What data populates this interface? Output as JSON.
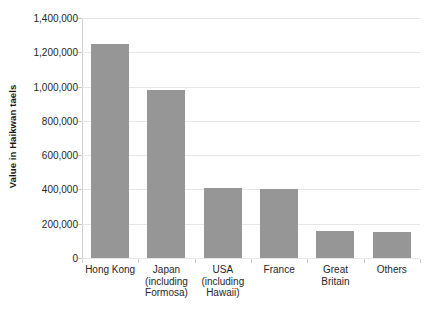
{
  "chart_data": {
    "type": "bar",
    "title": "",
    "xlabel": "",
    "ylabel": "Value in Haikwan taels",
    "ylim": [
      0,
      1400000
    ],
    "ytick_step": 200000,
    "grid": true,
    "legend": false,
    "orientation": "vertical",
    "bar_color": "#969696",
    "gridline_color": "#e6e6e6",
    "background_color": "#ffffff",
    "categories": [
      "Hong Kong",
      "Japan (including Formosa)",
      "USA (including Hawaii)",
      "France",
      "Great Britain",
      "Others"
    ],
    "category_label_lines": [
      [
        "Hong Kong"
      ],
      [
        "Japan",
        "(including",
        "Formosa)"
      ],
      [
        "USA",
        "(including",
        "Hawaii)"
      ],
      [
        "France"
      ],
      [
        "Great",
        "Britain"
      ],
      [
        "Others"
      ]
    ],
    "values": [
      1250000,
      980000,
      410000,
      400000,
      160000,
      150000
    ],
    "ytick_labels": [
      "0",
      "200,000",
      "400,000",
      "600,000",
      "800,000",
      "1,000,000",
      "1,200,000",
      "1,400,000"
    ],
    "ytick_values": [
      0,
      200000,
      400000,
      600000,
      800000,
      1000000,
      1200000,
      1400000
    ]
  }
}
